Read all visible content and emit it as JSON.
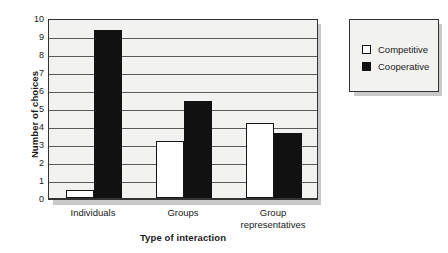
{
  "chart_data": {
    "type": "bar",
    "title": "",
    "xlabel": "Type of interaction",
    "ylabel": "Number of choices",
    "categories": [
      "Individuals",
      "Groups",
      "Group representatives"
    ],
    "series": [
      {
        "name": "Competitive",
        "color": "#ffffff",
        "values": [
          0.45,
          3.17,
          4.17
        ]
      },
      {
        "name": "Cooperative",
        "color": "#111111",
        "values": [
          9.33,
          5.39,
          3.6
        ]
      }
    ],
    "ylim": [
      0,
      10
    ],
    "ytick_labels": [
      "0",
      "1",
      "2",
      "3",
      "4",
      "5",
      "6",
      "7",
      "8",
      "9",
      "10"
    ],
    "ytick_values": [
      0,
      1,
      2,
      3,
      4,
      5,
      6,
      7,
      8,
      9,
      10
    ],
    "grid": "horizontal",
    "legend_position": "outside-right-top",
    "category_lines": [
      [
        "Individuals"
      ],
      [
        "Groups"
      ],
      [
        "Group",
        "representatives"
      ]
    ]
  },
  "legend": {
    "entries": [
      {
        "label": "Competitive",
        "swatch": "white-square-icon"
      },
      {
        "label": "Cooperative",
        "swatch": "black-square-icon"
      }
    ]
  },
  "axes": {
    "y_title": "Number of choices",
    "x_title": "Type of interaction"
  }
}
